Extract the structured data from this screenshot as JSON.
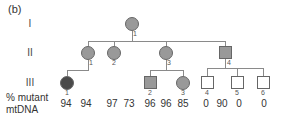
{
  "panel_label": "(b)",
  "generations": [
    "I",
    "II",
    "III"
  ],
  "individuals": {
    "I1": {
      "id": "1"
    },
    "II1": {
      "id": "1"
    },
    "II2": {
      "id": "2"
    },
    "II3": {
      "id": "3"
    },
    "II4": {
      "id": "4"
    },
    "III1": {
      "id": "1"
    },
    "III2": {
      "id": "2"
    },
    "III3": {
      "id": "3"
    },
    "III4": {
      "id": "4"
    },
    "III5": {
      "id": "5"
    },
    "III6": {
      "id": "6"
    }
  },
  "mutant_label": {
    "line1": "% mutant",
    "line2": "mtDNA"
  },
  "percentages": [
    "94",
    "94",
    "97",
    "73",
    "96",
    "96",
    "85",
    "0",
    "90",
    "0",
    "0"
  ],
  "colors": {
    "affected": "#999999",
    "dark_affected": "#4a4a4a",
    "unaffected": "#ffffff",
    "line": "#8a8a8a"
  }
}
